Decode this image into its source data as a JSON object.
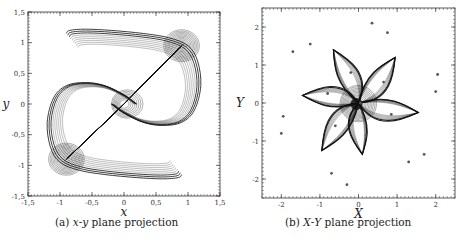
{
  "figure": {
    "panels": [
      {
        "id": "a",
        "caption_prefix": "(a)",
        "caption_var1": "x",
        "caption_sep": "-",
        "caption_var2": "y",
        "caption_rest": "plane projection",
        "xlabel": "x",
        "ylabel": "y",
        "xticks": [
          "-1,5",
          "-1",
          "-0,5",
          "0",
          "0,5",
          "1",
          "1,5"
        ],
        "yticks": [
          "-1,5",
          "-1",
          "-0,5",
          "0",
          "0,5",
          "1",
          "1,5"
        ]
      },
      {
        "id": "b",
        "caption_prefix": "(b)",
        "caption_var1": "X",
        "caption_sep": "-",
        "caption_var2": "Y",
        "caption_rest": "plane projection",
        "xlabel": "X",
        "ylabel": "Y",
        "xticks": [
          "-2",
          "-1",
          "0",
          "1",
          "2"
        ],
        "yticks": [
          "-2",
          "-1",
          "0",
          "1",
          "2"
        ]
      }
    ]
  },
  "chart_data": [
    {
      "type": "line",
      "title": "(a) x-y plane projection",
      "xlabel": "x",
      "ylabel": "y",
      "xlim": [
        -1.5,
        1.5
      ],
      "ylim": [
        -1.5,
        1.5
      ],
      "xticks": [
        -1.5,
        -1,
        -0.5,
        0,
        0.5,
        1,
        1.5
      ],
      "yticks": [
        -1.5,
        -1,
        -0.5,
        0,
        0.5,
        1,
        1.5
      ],
      "grid": false,
      "legend": null,
      "description": "Chaotic double-scroll attractor trajectory with two focal points near (0.9, 0.95) and (-0.9, -0.9), joined by a dense diagonal band through the origin; outer lobes reach y≈1.25 and y≈-1.25.",
      "key_points": [
        {
          "label": "upper focus",
          "x": 0.9,
          "y": 0.95
        },
        {
          "label": "lower focus",
          "x": -0.9,
          "y": -0.9
        },
        {
          "label": "center loop",
          "x": 0.0,
          "y": 0.0
        }
      ],
      "series": [
        {
          "name": "outer lobe upper",
          "x": [
            -0.9,
            -0.85,
            -0.6,
            -0.2,
            0.3,
            0.7,
            1.0,
            1.15,
            1.2,
            1.1,
            0.9,
            0.6,
            0.3,
            0.0,
            -0.2
          ],
          "y": [
            1.15,
            1.2,
            1.22,
            1.2,
            1.15,
            1.08,
            0.95,
            0.7,
            0.3,
            -0.1,
            -0.3,
            -0.35,
            -0.3,
            -0.15,
            0.0
          ]
        },
        {
          "name": "outer lobe lower",
          "x": [
            0.9,
            0.85,
            0.6,
            0.2,
            -0.3,
            -0.7,
            -1.0,
            -1.15,
            -1.2,
            -1.1,
            -0.9,
            -0.6,
            -0.3,
            0.0,
            0.2
          ],
          "y": [
            -1.15,
            -1.2,
            -1.22,
            -1.2,
            -1.15,
            -1.08,
            -0.95,
            -0.7,
            -0.3,
            0.1,
            0.3,
            0.35,
            0.3,
            0.15,
            0.0
          ]
        },
        {
          "name": "diagonal band",
          "x": [
            -0.9,
            -0.45,
            0.0,
            0.45,
            0.9
          ],
          "y": [
            -0.9,
            -0.45,
            0.0,
            0.48,
            0.95
          ]
        }
      ]
    },
    {
      "type": "line",
      "title": "(b) X-Y plane projection",
      "xlabel": "X",
      "ylabel": "Y",
      "xlim": [
        -2.5,
        2.5
      ],
      "ylim": [
        -2.5,
        2.5
      ],
      "xticks": [
        -2,
        -1,
        0,
        1,
        2
      ],
      "yticks": [
        -2,
        -1,
        0,
        1,
        2
      ],
      "grid": false,
      "legend": null,
      "description": "Five-petal rotating-frame projection of the attractor centered at the origin, with 20 scattered equilibrium points (dots).",
      "petal_tips": [
        {
          "x": -0.65,
          "y": 1.4
        },
        {
          "x": 0.95,
          "y": 1.2
        },
        {
          "x": 1.55,
          "y": -0.25
        },
        {
          "x": 0.1,
          "y": -1.35
        },
        {
          "x": -1.45,
          "y": 0.2
        },
        {
          "x": -0.95,
          "y": -1.25
        }
      ],
      "scatter_points": [
        {
          "x": 0.35,
          "y": 2.1
        },
        {
          "x": 0.75,
          "y": 1.85
        },
        {
          "x": -1.25,
          "y": 1.55
        },
        {
          "x": -1.7,
          "y": 1.35
        },
        {
          "x": -0.2,
          "y": 0.8
        },
        {
          "x": 0.65,
          "y": 0.55
        },
        {
          "x": 2.05,
          "y": 0.75
        },
        {
          "x": 2.0,
          "y": 0.3
        },
        {
          "x": -0.8,
          "y": 0.25
        },
        {
          "x": 0.85,
          "y": -0.3
        },
        {
          "x": -0.6,
          "y": -0.6
        },
        {
          "x": 0.2,
          "y": -0.85
        },
        {
          "x": -1.95,
          "y": -0.35
        },
        {
          "x": -2.0,
          "y": -0.8
        },
        {
          "x": 1.7,
          "y": -1.35
        },
        {
          "x": 1.3,
          "y": -1.55
        },
        {
          "x": -0.7,
          "y": -1.85
        },
        {
          "x": -0.3,
          "y": -2.15
        },
        {
          "x": 0.05,
          "y": 0.0
        }
      ]
    }
  ]
}
